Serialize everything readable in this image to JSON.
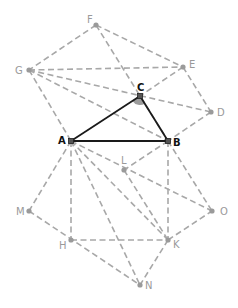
{
  "diagram": {
    "title": "",
    "points": {
      "A": {
        "x": 71,
        "y": 141,
        "label": "A",
        "style": "dark",
        "lx": -13,
        "ly": 3
      },
      "B": {
        "x": 168,
        "y": 141,
        "label": "B",
        "style": "dark",
        "lx": 5,
        "ly": 5
      },
      "C": {
        "x": 140,
        "y": 96,
        "label": "C",
        "style": "dark",
        "lx": -3,
        "ly": -5
      },
      "D": {
        "x": 211,
        "y": 112,
        "label": "D",
        "style": "gray",
        "lx": 6,
        "ly": 4
      },
      "E": {
        "x": 183,
        "y": 67,
        "label": "E",
        "style": "gray",
        "lx": 6,
        "ly": 1
      },
      "F": {
        "x": 96,
        "y": 25,
        "label": "F",
        "style": "gray",
        "lx": -9,
        "ly": -2
      },
      "G": {
        "x": 29,
        "y": 70,
        "label": "G",
        "style": "gray",
        "lx": -14,
        "ly": 4
      },
      "H": {
        "x": 71,
        "y": 240,
        "label": "H",
        "style": "gray",
        "lx": -12,
        "ly": 9
      },
      "K": {
        "x": 168,
        "y": 240,
        "label": "K",
        "style": "gray",
        "lx": 5,
        "ly": 8
      },
      "L": {
        "x": 124,
        "y": 170,
        "label": "L",
        "style": "gray",
        "lx": -3,
        "ly": -6
      },
      "M": {
        "x": 29,
        "y": 211,
        "label": "M",
        "style": "gray",
        "lx": -13,
        "ly": 4
      },
      "N": {
        "x": 140,
        "y": 285,
        "label": "N",
        "style": "gray",
        "lx": 5,
        "ly": 4
      },
      "O": {
        "x": 212,
        "y": 211,
        "label": "O",
        "style": "gray",
        "lx": 8,
        "ly": 4
      }
    },
    "solid_edges": [
      [
        "A",
        "B"
      ],
      [
        "B",
        "C"
      ],
      [
        "C",
        "A"
      ]
    ],
    "dashed_edges": [
      [
        "F",
        "G"
      ],
      [
        "F",
        "E"
      ],
      [
        "F",
        "B"
      ],
      [
        "G",
        "E"
      ],
      [
        "G",
        "D"
      ],
      [
        "G",
        "B"
      ],
      [
        "G",
        "A"
      ],
      [
        "E",
        "C"
      ],
      [
        "E",
        "D"
      ],
      [
        "D",
        "B"
      ],
      [
        "A",
        "M"
      ],
      [
        "A",
        "H"
      ],
      [
        "A",
        "N"
      ],
      [
        "A",
        "K"
      ],
      [
        "A",
        "O"
      ],
      [
        "B",
        "L"
      ],
      [
        "B",
        "K"
      ],
      [
        "B",
        "O"
      ],
      [
        "L",
        "K"
      ],
      [
        "M",
        "N"
      ],
      [
        "H",
        "K"
      ],
      [
        "K",
        "N"
      ],
      [
        "K",
        "O"
      ]
    ],
    "angle_mark": {
      "vertex": "C",
      "from": "A",
      "to": "B",
      "radius": 9
    },
    "colors": {
      "dashed": "#a8a8a8",
      "solid": "#1a1a1a",
      "label_gray": "#9a9a9a",
      "label_dark": "#111111",
      "angle_fill": "#9c9c9c"
    }
  }
}
